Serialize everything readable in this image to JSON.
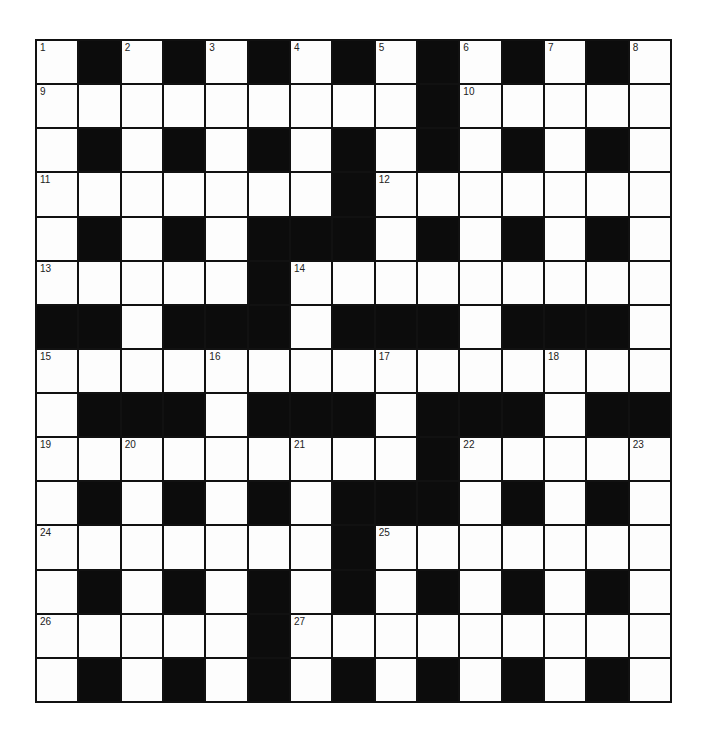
{
  "puzzle": {
    "rows": 15,
    "cols": 15,
    "colors": {
      "block": "#0c0c0c",
      "cell": "#fdfdfd",
      "line": "#111111",
      "number": "#222222"
    },
    "layout": [
      "W.W.W.W.W.W.W.W",
      "WWWWWWWWW.WWWWW",
      "W.W.W.W.W.W.W.W",
      "WWWWWWW.WWWWWWW",
      "W.W.W...W.W.W.W",
      "WWWWW.WWWWWWWWW",
      "..W...W...W...W",
      "WWWWWWWWWWWWWWW",
      "W...W...W...W..",
      "WWWWWWWWW.WWWWW",
      "W.W.W.W...W.W.W",
      "WWWWWWW.WWWWWWW",
      "W.W.W.W.W.W.W.W",
      "WWWWW.WWWWWWWWW",
      "W.W.W.W.W.W.W.W"
    ],
    "numbers": [
      {
        "row": 0,
        "col": 0,
        "n": "1"
      },
      {
        "row": 0,
        "col": 2,
        "n": "2"
      },
      {
        "row": 0,
        "col": 4,
        "n": "3"
      },
      {
        "row": 0,
        "col": 6,
        "n": "4"
      },
      {
        "row": 0,
        "col": 8,
        "n": "5"
      },
      {
        "row": 0,
        "col": 10,
        "n": "6"
      },
      {
        "row": 0,
        "col": 12,
        "n": "7"
      },
      {
        "row": 0,
        "col": 14,
        "n": "8"
      },
      {
        "row": 1,
        "col": 0,
        "n": "9"
      },
      {
        "row": 1,
        "col": 10,
        "n": "10"
      },
      {
        "row": 3,
        "col": 0,
        "n": "11"
      },
      {
        "row": 3,
        "col": 8,
        "n": "12"
      },
      {
        "row": 5,
        "col": 0,
        "n": "13"
      },
      {
        "row": 5,
        "col": 6,
        "n": "14"
      },
      {
        "row": 7,
        "col": 0,
        "n": "15"
      },
      {
        "row": 7,
        "col": 4,
        "n": "16"
      },
      {
        "row": 7,
        "col": 8,
        "n": "17"
      },
      {
        "row": 7,
        "col": 12,
        "n": "18"
      },
      {
        "row": 9,
        "col": 0,
        "n": "19"
      },
      {
        "row": 9,
        "col": 2,
        "n": "20"
      },
      {
        "row": 9,
        "col": 6,
        "n": "21"
      },
      {
        "row": 9,
        "col": 10,
        "n": "22"
      },
      {
        "row": 9,
        "col": 14,
        "n": "23"
      },
      {
        "row": 11,
        "col": 0,
        "n": "24"
      },
      {
        "row": 11,
        "col": 8,
        "n": "25"
      },
      {
        "row": 13,
        "col": 0,
        "n": "26"
      },
      {
        "row": 13,
        "col": 6,
        "n": "27"
      }
    ],
    "entries": {}
  }
}
